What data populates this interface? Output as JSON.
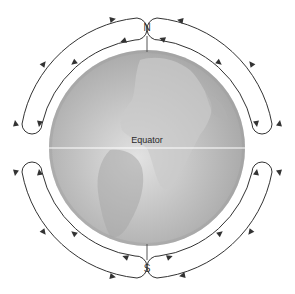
{
  "diagram": {
    "title": "",
    "globe": {
      "cx": 147,
      "cy": 148,
      "r": 98,
      "colors": {
        "base": "#b4b4b4",
        "light": "#dedede",
        "dark": "#9a9a9a",
        "land": "#c6c6c6"
      }
    },
    "equator": {
      "label": "Equator",
      "line_color": "#ffffff"
    },
    "poles": {
      "north": "N",
      "south": "S"
    },
    "arrow_color": "#333333",
    "circulation_cells": [
      {
        "id": "northwest-cell",
        "hemisphere": "northern",
        "side": "west"
      },
      {
        "id": "northeast-cell",
        "hemisphere": "northern",
        "side": "east"
      },
      {
        "id": "southwest-cell",
        "hemisphere": "southern",
        "side": "west"
      },
      {
        "id": "southeast-cell",
        "hemisphere": "southern",
        "side": "east"
      }
    ]
  }
}
